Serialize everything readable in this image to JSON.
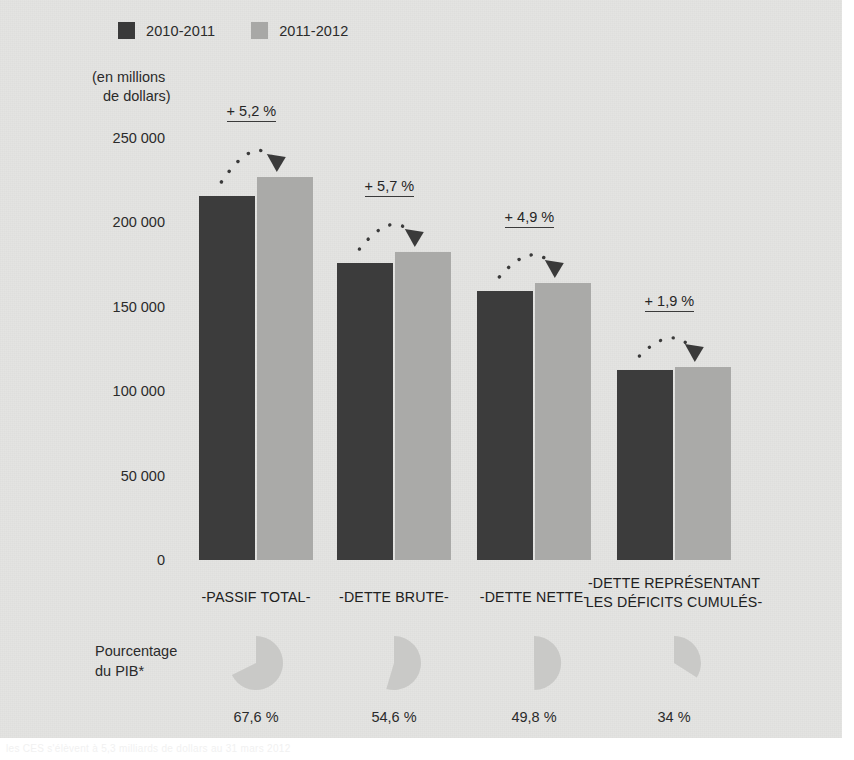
{
  "figure": {
    "background_color": "#e4e4e2",
    "dark_color": "#3c3c3c",
    "light_color": "#aaaaa8"
  },
  "legend": {
    "items": [
      {
        "label": "2010-2011",
        "color": "#3a3a3a"
      },
      {
        "label": "2011-2012",
        "color": "#a8a8a6"
      }
    ]
  },
  "units_caption": {
    "line1": "(en millions",
    "line2": "de dollars)"
  },
  "pie_row": {
    "label_line1": "Pourcentage",
    "label_line2": "du PIB*"
  },
  "ghost_footer": {
    "text": "les CES s'élèvent à 5,3 milliards de dollars au 31 mars 2012"
  },
  "chart_data": {
    "type": "bar",
    "title": "",
    "subtitle": "",
    "xlabel": "",
    "ylabel": "(en millions de dollars)",
    "ylim": [
      0,
      250000
    ],
    "yticks": [
      "0",
      "50 000",
      "100 000",
      "150 000",
      "200 000",
      "250 000"
    ],
    "ytick_values": [
      0,
      50000,
      100000,
      150000,
      200000,
      250000
    ],
    "grid": false,
    "legend_position": "top-left",
    "categories": [
      "-PASSIF TOTAL-",
      "-DETTE BRUTE-",
      "-DETTE NETTE-",
      "-DETTE REPRÉSENTANT LES DÉFICITS CUMULÉS-"
    ],
    "category_lines": [
      [
        "-PASSIF TOTAL-"
      ],
      [
        "-DETTE BRUTE-"
      ],
      [
        "-DETTE NETTE-"
      ],
      [
        "-DETTE REPRÉSENTANT",
        "LES DÉFICITS CUMULÉS-"
      ]
    ],
    "series": [
      {
        "name": "2010-2011",
        "color": "#3c3c3c",
        "values": [
          215400,
          175700,
          159200,
          112400
        ]
      },
      {
        "name": "2011-2012",
        "color": "#aaaaa8",
        "values": [
          226600,
          182200,
          163900,
          114200
        ]
      }
    ],
    "annotations": [
      {
        "category": "-PASSIF TOTAL-",
        "text": "+ 5,2 %",
        "value": 5.2
      },
      {
        "category": "-DETTE BRUTE-",
        "text": "+ 5,7 %",
        "value": 5.7
      },
      {
        "category": "-DETTE NETTE-",
        "text": "+ 4,9 %",
        "value": 4.9
      },
      {
        "category": "-DETTE REPRÉSENTANT LES DÉFICITS CUMULÉS-",
        "text": "+ 1,9 %",
        "value": 1.9
      }
    ],
    "secondary": {
      "type": "pie",
      "label": "Pourcentage du PIB*",
      "slices": [
        {
          "category": "-PASSIF TOTAL-",
          "label": "67,6 %",
          "value": 67.6
        },
        {
          "category": "-DETTE BRUTE-",
          "label": "54,6 %",
          "value": 54.6
        },
        {
          "category": "-DETTE NETTE-",
          "label": "49,8 %",
          "value": 49.8
        },
        {
          "category": "-DETTE REPRÉSENTANT LES DÉFICITS CUMULÉS-",
          "label": "34 %",
          "value": 34
        }
      ]
    }
  }
}
